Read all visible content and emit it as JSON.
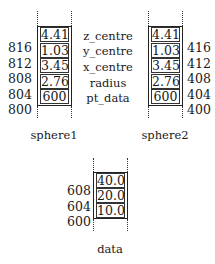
{
  "diagram": {
    "type": "memory-layout",
    "structs": [
      {
        "name": "sphere1",
        "cells": [
          "4.41",
          "1.03",
          "3.45",
          "2.76",
          "600"
        ],
        "addresses": [
          "816",
          "812",
          "808",
          "804",
          "800"
        ],
        "address_side": "left"
      },
      {
        "name": "sphere2",
        "cells": [
          "4.41",
          "1.03",
          "3.45",
          "2.76",
          "600"
        ],
        "addresses": [
          "416",
          "412",
          "408",
          "404",
          "400"
        ],
        "address_side": "right"
      },
      {
        "name": "data",
        "cells": [
          "40.0",
          "20.0",
          "10.0"
        ],
        "addresses": [
          "608",
          "604",
          "600"
        ],
        "address_side": "left"
      }
    ],
    "field_labels": [
      "z_centre",
      "y_centre",
      "x_centre",
      "radius",
      "pt_data"
    ]
  }
}
